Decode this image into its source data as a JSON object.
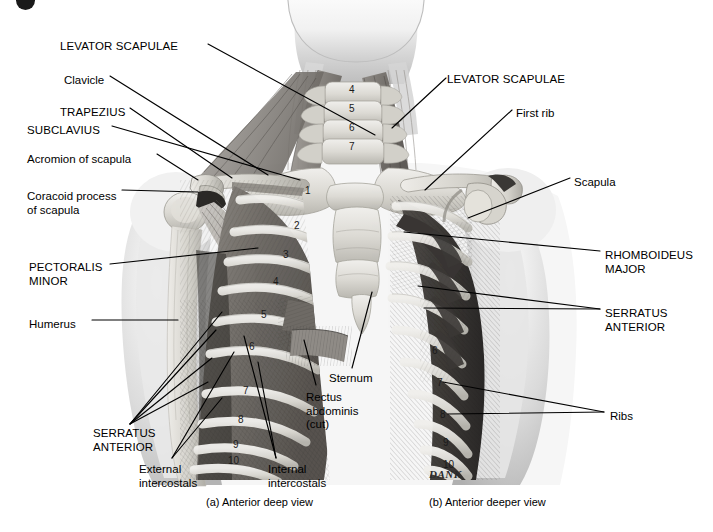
{
  "figure": {
    "title_absent": true,
    "background_color": "#ffffff",
    "ink_color": "#000000",
    "signature": "DANK"
  },
  "captions": [
    {
      "id": "caption-a",
      "text": "(a) Anterior deep view",
      "x": 206,
      "y": 502
    },
    {
      "id": "caption-b",
      "text": "(b) Anterior deeper view",
      "x": 429,
      "y": 502
    }
  ],
  "labels_left": [
    {
      "id": "levator-scapulae-left",
      "text": "LEVATOR SCAPULAE",
      "style": "caps",
      "x": 60,
      "y": 40
    },
    {
      "id": "clavicle",
      "text": "Clavicle",
      "style": "mixed",
      "x": 64,
      "y": 74
    },
    {
      "id": "trapezius",
      "text": "TRAPEZIUS",
      "style": "caps",
      "x": 60,
      "y": 106
    },
    {
      "id": "subclavius",
      "text": "SUBCLAVIUS",
      "style": "caps",
      "x": 27,
      "y": 124
    },
    {
      "id": "acromion-of-scapula",
      "text": "Acromion of scapula",
      "style": "mixed",
      "x": 27,
      "y": 153
    },
    {
      "id": "coracoid-process-of-scapula",
      "text": "Coracoid process\nof scapula",
      "style": "mixed",
      "x": 27,
      "y": 190
    },
    {
      "id": "pectoralis-minor",
      "text": "PECTORALIS\nMINOR",
      "style": "caps",
      "x": 29,
      "y": 261
    },
    {
      "id": "humerus",
      "text": "Humerus",
      "style": "mixed",
      "x": 29,
      "y": 318
    },
    {
      "id": "serratus-anterior-left",
      "text": "SERRATUS\nANTERIOR",
      "style": "caps",
      "x": 93,
      "y": 427
    },
    {
      "id": "external-intercostals",
      "text": "External\nintercostals",
      "style": "mixed",
      "x": 139,
      "y": 463
    }
  ],
  "labels_center": [
    {
      "id": "sternum",
      "text": "Sternum",
      "style": "mixed",
      "x": 329,
      "y": 372
    },
    {
      "id": "rectus-abdominis-cut",
      "text": "Rectus\nabdominis\n(cut)",
      "style": "mixed",
      "x": 306,
      "y": 391
    },
    {
      "id": "internal-intercostals",
      "text": "Internal\nintercostals",
      "style": "mixed",
      "x": 268,
      "y": 463
    }
  ],
  "labels_right": [
    {
      "id": "levator-scapulae-right",
      "text": "LEVATOR SCAPULAE",
      "style": "caps",
      "x": 447,
      "y": 73
    },
    {
      "id": "first-rib",
      "text": "First rib",
      "style": "mixed",
      "x": 516,
      "y": 107
    },
    {
      "id": "scapula",
      "text": "Scapula",
      "style": "mixed",
      "x": 574,
      "y": 176
    },
    {
      "id": "rhomboideus-major",
      "text": "RHOMBOIDEUS\nMAJOR",
      "style": "caps",
      "x": 605,
      "y": 249
    },
    {
      "id": "serratus-anterior-right",
      "text": "SERRATUS\nANTERIOR",
      "style": "caps",
      "x": 605,
      "y": 307
    },
    {
      "id": "ribs",
      "text": "Ribs",
      "style": "mixed",
      "x": 610,
      "y": 410
    }
  ],
  "structure_numbers": {
    "cervical_vertebrae_left_view": [
      "4",
      "5",
      "6",
      "7"
    ],
    "ribs_left_view": [
      "1",
      "2",
      "3",
      "4",
      "5",
      "6",
      "7",
      "8",
      "9",
      "10"
    ],
    "ribs_right_view": [
      "6",
      "7",
      "8",
      "9",
      "10"
    ]
  },
  "numbers_plotted": [
    {
      "t": "4",
      "x": 349,
      "y": 93,
      "sz": 10
    },
    {
      "t": "5",
      "x": 349,
      "y": 112,
      "sz": 10
    },
    {
      "t": "6",
      "x": 349,
      "y": 131,
      "sz": 10
    },
    {
      "t": "7",
      "x": 349,
      "y": 150,
      "sz": 10
    },
    {
      "t": "1",
      "x": 305,
      "y": 194,
      "sz": 10
    },
    {
      "t": "2",
      "x": 294,
      "y": 229,
      "sz": 10
    },
    {
      "t": "3",
      "x": 283,
      "y": 258,
      "sz": 10
    },
    {
      "t": "4",
      "x": 273,
      "y": 285,
      "sz": 10
    },
    {
      "t": "5",
      "x": 261,
      "y": 318,
      "sz": 10
    },
    {
      "t": "6",
      "x": 249,
      "y": 350,
      "sz": 10
    },
    {
      "t": "7",
      "x": 243,
      "y": 394,
      "sz": 10
    },
    {
      "t": "8",
      "x": 238,
      "y": 423,
      "sz": 10
    },
    {
      "t": "9",
      "x": 233,
      "y": 448,
      "sz": 10
    },
    {
      "t": "10",
      "x": 228,
      "y": 464,
      "sz": 10
    },
    {
      "t": "6",
      "x": 432,
      "y": 354,
      "sz": 10
    },
    {
      "t": "7",
      "x": 437,
      "y": 386,
      "sz": 10
    },
    {
      "t": "8",
      "x": 440,
      "y": 418,
      "sz": 10
    },
    {
      "t": "9",
      "x": 443,
      "y": 446,
      "sz": 10
    },
    {
      "t": "10",
      "x": 443,
      "y": 468,
      "sz": 10
    }
  ],
  "leader_lines": [
    {
      "id": "leader-levator-left",
      "pts": "208,44 375,135"
    },
    {
      "id": "leader-clavicle",
      "pts": "110,76 268,175"
    },
    {
      "id": "leader-trapezius",
      "pts": "130,108 232,178"
    },
    {
      "id": "leader-subclavius",
      "pts": "112,126 300,180"
    },
    {
      "id": "leader-acromion",
      "pts": "157,154 198,180"
    },
    {
      "id": "leader-coracoid",
      "pts": "122,190 198,192"
    },
    {
      "id": "leader-pectoralis-minor",
      "pts": "110,264 258,248"
    },
    {
      "id": "leader-humerus",
      "pts": "92,320 178,320"
    },
    {
      "id": "leader-serr-a-1",
      "pts": "130,424 222,312"
    },
    {
      "id": "leader-serr-a-2",
      "pts": "130,424 216,330"
    },
    {
      "id": "leader-serr-a-3",
      "pts": "130,424 212,358"
    },
    {
      "id": "leader-serr-a-4",
      "pts": "130,424 208,382"
    },
    {
      "id": "leader-external-1",
      "pts": "172,458 222,398"
    },
    {
      "id": "leader-external-2",
      "pts": "172,458 234,352"
    },
    {
      "id": "leader-internal-1",
      "pts": "276,458 244,336"
    },
    {
      "id": "leader-internal-2",
      "pts": "276,458 258,362"
    },
    {
      "id": "leader-sternum",
      "pts": "352,368 372,292"
    },
    {
      "id": "leader-rectus",
      "pts": "316,385 304,340"
    },
    {
      "id": "leader-levator-right",
      "pts": "446,78 392,128"
    },
    {
      "id": "leader-first-rib",
      "pts": "512,110 425,190"
    },
    {
      "id": "leader-scapula",
      "pts": "570,178 468,218"
    },
    {
      "id": "leader-rhomboideus",
      "pts": "600,251 404,232"
    },
    {
      "id": "leader-serr-right-1",
      "pts": "600,309 418,286"
    },
    {
      "id": "leader-serr-right-2",
      "pts": "600,309 424,308"
    },
    {
      "id": "leader-ribs-1",
      "pts": "604,412 443,382"
    },
    {
      "id": "leader-ribs-2",
      "pts": "604,412 448,414"
    }
  ]
}
